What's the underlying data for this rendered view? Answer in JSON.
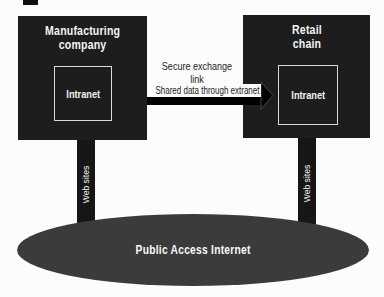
{
  "colors": {
    "background": "#fcfcfc",
    "node_box": "#1d1d1d",
    "bar": "#161616",
    "ellipse": "#3b3b3b",
    "arrow": "#000000",
    "inner_border": "#d9d9d9",
    "dark_text": "#1b1b1b",
    "light_text": "#f4f4f4"
  },
  "nodes": {
    "manufacturing": {
      "title_lines": [
        "Manufacturing",
        "company"
      ],
      "intranet_label": "Intranet",
      "web_label": "Web sites"
    },
    "retail": {
      "title_lines": [
        "Retail",
        "chain"
      ],
      "intranet_label": "Intranet",
      "web_label": "Web sites"
    }
  },
  "connection": {
    "secure_line1": "Secure exchange",
    "secure_line2": "link",
    "extranet_label": "Shared data through extranet"
  },
  "internet": {
    "label": "Public Access Internet"
  }
}
